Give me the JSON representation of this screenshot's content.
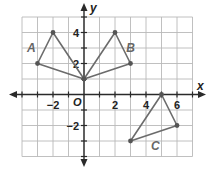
{
  "figure": {
    "type": "coordinate-plane",
    "x_axis_label": "x",
    "y_axis_label": "y",
    "origin_label": "O",
    "x_range": [
      -4,
      7
    ],
    "y_range": [
      -4,
      5
    ],
    "grid_step": 1,
    "x_tick_labels": [
      {
        "value": -2,
        "text": "−2"
      },
      {
        "value": 2,
        "text": "2"
      },
      {
        "value": 4,
        "text": "4"
      },
      {
        "value": 6,
        "text": "6"
      }
    ],
    "y_tick_labels": [
      {
        "value": 4,
        "text": "4"
      },
      {
        "value": 2,
        "text": "2"
      },
      {
        "value": -2,
        "text": "−2"
      }
    ],
    "shapes": [
      {
        "name": "A",
        "label": "A",
        "vertices": [
          [
            -3,
            2
          ],
          [
            -2,
            4
          ],
          [
            0,
            1
          ]
        ],
        "label_pos": [
          -3.4,
          3.0
        ]
      },
      {
        "name": "B",
        "label": "B",
        "vertices": [
          [
            0,
            1
          ],
          [
            2,
            4
          ],
          [
            3,
            2
          ]
        ],
        "label_pos": [
          3.0,
          3.0
        ]
      },
      {
        "name": "C",
        "label": "C",
        "vertices": [
          [
            5,
            0
          ],
          [
            6,
            -2
          ],
          [
            3,
            -3
          ]
        ],
        "label_pos": [
          4.6,
          -3.3
        ]
      }
    ],
    "colors": {
      "grid": "#b9b9b9",
      "axis": "#2a2a2a",
      "shape_stroke": "#6b6b6b",
      "vertex": "#555555"
    }
  }
}
